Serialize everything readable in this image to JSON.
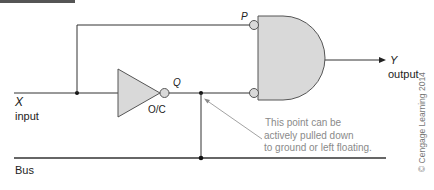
{
  "colors": {
    "wire": "#333333",
    "gate_fill": "#d9d9d9",
    "gate_stroke": "#555555",
    "bus": "#666666",
    "note_text": "#8a8a8a",
    "header_bar": "#555555"
  },
  "labels": {
    "input_symbol": "X",
    "input_caption": "input",
    "output_symbol": "Y",
    "output_caption": "output",
    "node_p": "P",
    "node_q": "Q",
    "inverter_type": "O/C",
    "bus": "Bus"
  },
  "annotation": {
    "line1": "This point can be",
    "line2": "actively pulled down",
    "line3": "to ground or left floating."
  },
  "copyright": "© Cengage Learning 2014",
  "components": [
    {
      "type": "inverter",
      "label": "O/C",
      "output_node": "Q"
    },
    {
      "type": "and_gate",
      "inverted_inputs": [
        "P",
        "Q"
      ],
      "output": "Y"
    }
  ]
}
